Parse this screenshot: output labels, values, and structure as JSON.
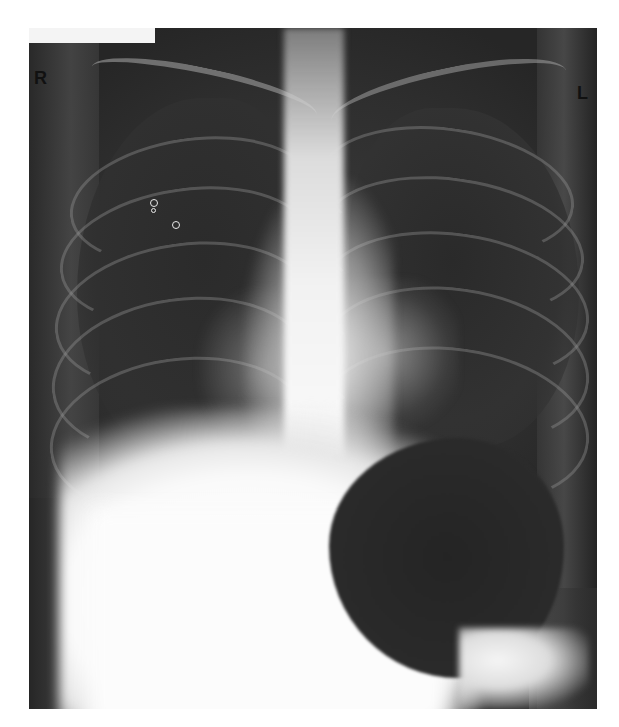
{
  "image": {
    "type": "chest-radiograph",
    "view": "frontal (PA)",
    "markers": {
      "left_side_marker": "R",
      "right_side_marker": "L"
    },
    "features": [
      "three small ring-shaped radiopaque markers in right upper lung field",
      "large gas-filled gastric bubble below left hemidiaphragm",
      "dense white liver/diaphragm shadow lower right hemithorax",
      "central spine and mediastinum",
      "bilateral rib arcs"
    ],
    "colors": {
      "background": "#ffffff",
      "film_dark": "#2a2a2a",
      "bone_bright": "#f5f5f5"
    }
  }
}
